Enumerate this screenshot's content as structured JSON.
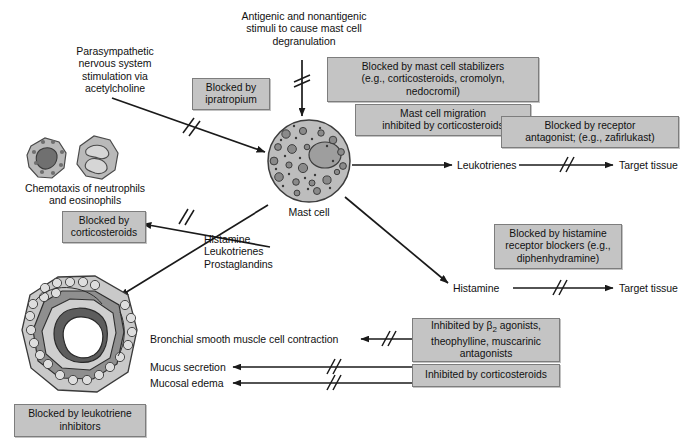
{
  "diagram": {
    "colors": {
      "box_fill": "#c4c4c4",
      "box_border": "#7d7d7d",
      "line": "#1a1a1a",
      "cell_fill": "#b6b6b6",
      "background": "#ffffff"
    }
  },
  "labels": {
    "antigenic_stimuli": "Antigenic and nonantigenic\nstimuli to cause mast cell\ndegranulation",
    "parasympathetic": "Parasympathetic\nnervous system\nstimulation via\nacetylcholine",
    "chemotaxis": "Chemotaxis of neutrophils\nand eosinophils",
    "mast_cell": "Mast cell",
    "mediators": "Histamine\nLeukotrienes\nProstaglandins",
    "leukotrienes": "Leukotrienes",
    "histamine": "Histamine",
    "target_tissue_leukotriene": "Target tissue",
    "target_tissue_histamine": "Target tissue",
    "bronchial_contraction": "Bronchial smooth muscle cell contraction",
    "mucus_secretion": "Mucus secretion",
    "mucosal_edema": "Mucosal edema"
  },
  "boxes": {
    "ipratropium": "Blocked by\nipratropium",
    "mast_cell_stabilizers": "Blocked by mast cell stabilizers\n(e.g., corticosteroids, cromolyn,\nnedocromil)",
    "mast_cell_migration": "Mast cell migration\ninhibited by corticosteroids",
    "receptor_antagonist": "Blocked by receptor\nantagonist; (e.g., zafirlukast)",
    "corticosteroids_chemotaxis": "Blocked by\ncorticosteroids",
    "histamine_blockers": "Blocked by histamine\nreceptor blockers (e.g.,\ndiphenhydramine)",
    "beta2_agonists_line1": "Inhibited by β",
    "beta2_agonists_sub": "2",
    "beta2_agonists_line2": " agonists,",
    "beta2_agonists_line3": "theophylline, muscarinic\nantagonists",
    "inhibited_corticosteroids": "Inhibited by corticosteroids",
    "leukotriene_inhibitors": "Blocked by leukotriene\ninhibitors"
  },
  "icons": {
    "neutrophil": "neutrophil-cell-icon",
    "eosinophil": "eosinophil-cell-icon",
    "mast_cell": "mast-cell-icon",
    "bronchiole": "bronchiole-cross-section-icon"
  }
}
